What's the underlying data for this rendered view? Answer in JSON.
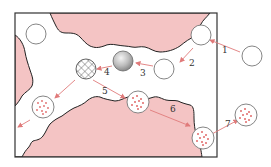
{
  "diagram": {
    "type": "process-steps",
    "colors": {
      "tissue_fill": "#f4c4c4",
      "tissue_stroke": "#222222",
      "frame_stroke": "#333333",
      "arrow": "#e07a7a",
      "circle_stroke": "#777777",
      "dot": "#e06a6a"
    },
    "steps": [
      {
        "n": "1",
        "label": "1"
      },
      {
        "n": "2",
        "label": "2"
      },
      {
        "n": "3",
        "label": "3"
      },
      {
        "n": "4",
        "label": "4"
      },
      {
        "n": "5",
        "label": "5"
      },
      {
        "n": "6",
        "label": "6"
      },
      {
        "n": "7",
        "label": "7"
      }
    ],
    "particles": [
      {
        "id": "empty-outside",
        "kind": "empty-circle"
      },
      {
        "id": "empty-entry",
        "kind": "empty-circle"
      },
      {
        "id": "empty-descending",
        "kind": "empty-circle"
      },
      {
        "id": "empty-top-left",
        "kind": "empty-circle"
      },
      {
        "id": "gray-sphere",
        "kind": "shaded-sphere"
      },
      {
        "id": "hatched-sphere",
        "kind": "crosshatched-circle"
      },
      {
        "id": "dotted-left",
        "kind": "dotted-circle"
      },
      {
        "id": "dotted-center",
        "kind": "dotted-circle"
      },
      {
        "id": "dotted-exit",
        "kind": "dotted-circle"
      },
      {
        "id": "dotted-outside",
        "kind": "dotted-circle"
      }
    ]
  }
}
